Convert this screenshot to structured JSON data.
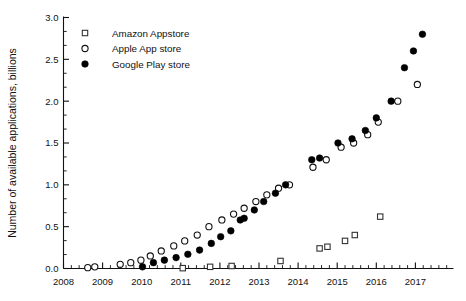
{
  "chart_data": {
    "type": "scatter",
    "title": "",
    "xlabel": "",
    "ylabel": "Number of available applications, billions",
    "xlim": [
      2008,
      2017.9
    ],
    "ylim": [
      0.0,
      3.0
    ],
    "grid": false,
    "legend_position": "top-left",
    "x_ticks": [
      "2008",
      "2009",
      "2010",
      "2011",
      "2012",
      "2013",
      "2014",
      "2015",
      "2016",
      "2017"
    ],
    "x_tick_values": [
      2008,
      2009,
      2010,
      2011,
      2012,
      2013,
      2014,
      2015,
      2016,
      2017
    ],
    "x_minor_per_major": 4,
    "y_ticks": [
      "0.0",
      "0.5",
      "1.0",
      "1.5",
      "2.0",
      "2.5",
      "3.0"
    ],
    "y_tick_values": [
      0.0,
      0.5,
      1.0,
      1.5,
      2.0,
      2.5,
      3.0
    ],
    "y_minor_per_major": 2,
    "series": [
      {
        "name": "Amazon Appstore",
        "marker": "open-square",
        "color": "#333333",
        "points": [
          [
            2011.05,
            0.004
          ],
          [
            2011.75,
            0.02
          ],
          [
            2012.3,
            0.03
          ],
          [
            2013.55,
            0.09
          ],
          [
            2014.55,
            0.24
          ],
          [
            2014.75,
            0.26
          ],
          [
            2015.2,
            0.33
          ],
          [
            2015.45,
            0.4
          ],
          [
            2016.1,
            0.62
          ]
        ]
      },
      {
        "name": "Apple App store",
        "marker": "open-circle",
        "color": "#111111",
        "points": [
          [
            2008.62,
            0.01
          ],
          [
            2008.8,
            0.02
          ],
          [
            2009.45,
            0.05
          ],
          [
            2009.72,
            0.07
          ],
          [
            2009.98,
            0.1
          ],
          [
            2010.22,
            0.15
          ],
          [
            2010.5,
            0.21
          ],
          [
            2010.82,
            0.27
          ],
          [
            2011.1,
            0.33
          ],
          [
            2011.42,
            0.4
          ],
          [
            2011.72,
            0.5
          ],
          [
            2012.05,
            0.58
          ],
          [
            2012.35,
            0.65
          ],
          [
            2012.62,
            0.72
          ],
          [
            2012.92,
            0.8
          ],
          [
            2013.2,
            0.88
          ],
          [
            2013.5,
            0.96
          ],
          [
            2013.78,
            1.0
          ],
          [
            2014.38,
            1.21
          ],
          [
            2014.72,
            1.3
          ],
          [
            2015.1,
            1.45
          ],
          [
            2015.42,
            1.5
          ],
          [
            2015.78,
            1.6
          ],
          [
            2016.05,
            1.75
          ],
          [
            2016.55,
            2.0
          ],
          [
            2017.05,
            2.2
          ]
        ]
      },
      {
        "name": "Google Play store",
        "marker": "filled-circle",
        "color": "#000000",
        "points": [
          [
            2010.02,
            0.02
          ],
          [
            2010.3,
            0.07
          ],
          [
            2010.58,
            0.1
          ],
          [
            2010.88,
            0.13
          ],
          [
            2011.18,
            0.17
          ],
          [
            2011.48,
            0.22
          ],
          [
            2011.78,
            0.3
          ],
          [
            2012.02,
            0.38
          ],
          [
            2012.28,
            0.45
          ],
          [
            2012.52,
            0.58
          ],
          [
            2012.62,
            0.6
          ],
          [
            2012.88,
            0.7
          ],
          [
            2013.12,
            0.8
          ],
          [
            2013.42,
            0.9
          ],
          [
            2013.68,
            1.0
          ],
          [
            2014.35,
            1.3
          ],
          [
            2014.55,
            1.32
          ],
          [
            2015.02,
            1.5
          ],
          [
            2015.38,
            1.55
          ],
          [
            2015.72,
            1.65
          ],
          [
            2016.0,
            1.8
          ],
          [
            2016.38,
            2.0
          ],
          [
            2016.72,
            2.4
          ],
          [
            2016.95,
            2.6
          ],
          [
            2017.18,
            2.8
          ]
        ]
      }
    ]
  },
  "legend": {
    "entries": [
      {
        "label": "Amazon Appstore",
        "marker": "open-square"
      },
      {
        "label": "Apple App store",
        "marker": "open-circle"
      },
      {
        "label": "Google Play store",
        "marker": "filled-circle"
      }
    ]
  }
}
